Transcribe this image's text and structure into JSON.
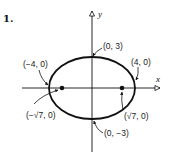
{
  "problem_number": "1.",
  "axes": {
    "x_label": "x",
    "y_label": "y"
  },
  "ellipse": {
    "center": [
      0,
      0
    ],
    "semi_major_a": 4,
    "semi_minor_b": 3,
    "focal_c": "√7"
  },
  "points": {
    "vertex_left": "(−4, 0)",
    "vertex_right": "(4, 0)",
    "covertex_top": "(0, 3)",
    "covertex_bottom": "(0, −3)",
    "focus_left": "(−√7, 0)",
    "focus_right": "(√7, 0)"
  },
  "stroke_color": "#111111"
}
